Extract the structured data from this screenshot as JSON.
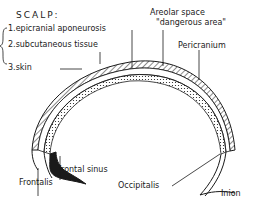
{
  "diagram": {
    "colors": {
      "ink": "#1a1a1a",
      "background": "#ffffff"
    }
  },
  "labels": {
    "title": "SCALP:",
    "layers": [
      "1.epicranial aponeurosis",
      "2.subcutaneous tissue",
      "3.skin"
    ],
    "areolar_space_line1": "Areolar space",
    "areolar_space_line2": "\"dangerous area\"",
    "pericranium": "Pericranium",
    "frontal_sinus": "Frontal sinus",
    "frontalis": "Frontalis",
    "occipitalis": "Occipitalis",
    "inion": "Inion"
  }
}
